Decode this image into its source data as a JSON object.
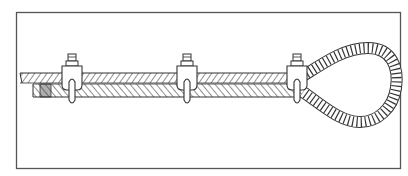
{
  "figure": {
    "frame": {
      "x": 16,
      "y": 12,
      "width": 385,
      "height": 157
    },
    "colors": {
      "line": "#333333",
      "frame": "#555555",
      "background": "#ffffff"
    },
    "clips": [
      {
        "id": "clip-1",
        "cx": 72
      },
      {
        "id": "clip-2",
        "cx": 187
      },
      {
        "id": "clip-3",
        "cx": 297
      }
    ]
  }
}
